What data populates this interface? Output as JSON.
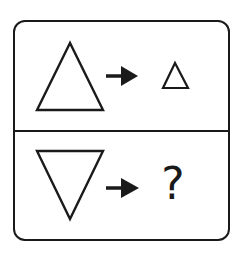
{
  "puzzle": {
    "rows": [
      {
        "input_shape": "triangle-up-large",
        "operator": "arrow-right",
        "output_shape": "triangle-up-small"
      },
      {
        "input_shape": "triangle-down-large",
        "operator": "arrow-right",
        "output_label": "?"
      }
    ]
  },
  "colors": {
    "stroke": "#1a1a1a",
    "background": "#ffffff"
  }
}
